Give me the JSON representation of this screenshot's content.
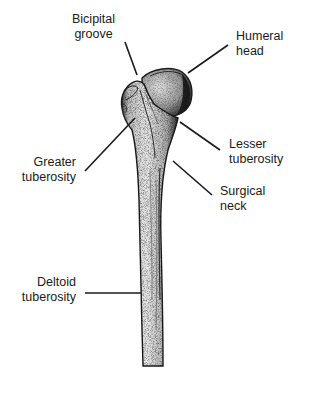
{
  "diagram": {
    "labels": [
      {
        "id": "bicipital-groove",
        "line1": "Bicipital",
        "line2": "groove"
      },
      {
        "id": "humeral-head",
        "line1": "Humeral",
        "line2": "head"
      },
      {
        "id": "greater-tuberosity",
        "line1": "Greater",
        "line2": "tuberosity"
      },
      {
        "id": "lesser-tuberosity",
        "line1": "Lesser",
        "line2": "tuberosity"
      },
      {
        "id": "surgical-neck",
        "line1": "Surgical",
        "line2": "neck"
      },
      {
        "id": "deltoid-tuberosity",
        "line1": "Deltoid",
        "line2": "tuberosity"
      }
    ],
    "colors": {
      "background": "#ffffff",
      "ink": "#1a1a1a",
      "bone_fill": "#d6d6d6",
      "bone_shadow": "#4a4a4a"
    }
  }
}
